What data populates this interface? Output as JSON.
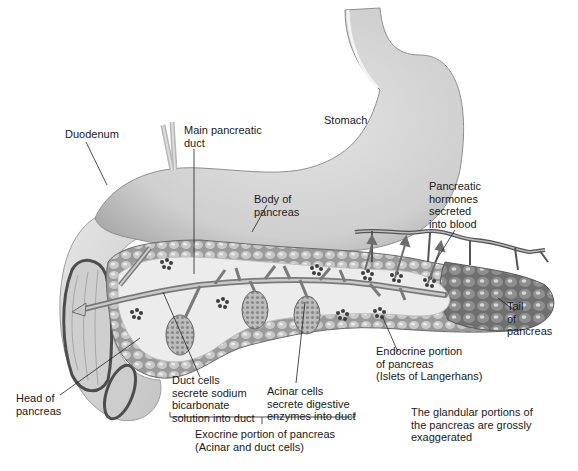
{
  "diagram": {
    "labels": {
      "duodenum": [
        "Duodenum"
      ],
      "main_duct": [
        "Main pancreatic",
        "duct"
      ],
      "stomach": [
        "Stomach"
      ],
      "body": [
        "Body of",
        "pancreas"
      ],
      "hormones": [
        "Pancreatic",
        "hormones",
        "secreted",
        "into blood"
      ],
      "tail": [
        "Tail",
        "of",
        "pancreas"
      ],
      "endocrine": [
        "Endocrine portion",
        "of pancreas",
        "(Islets of Langerhans)"
      ],
      "head": [
        "Head of",
        "pancreas"
      ],
      "duct_cells": [
        "Duct cells",
        "secrete sodium",
        "bicarbonate",
        "solution into duct"
      ],
      "acinar_cells": [
        "Acinar cells",
        "secrete digestive",
        "enzymes into duct"
      ],
      "exocrine": [
        "Exocrine portion of pancreas",
        "(Acinar and duct cells)"
      ],
      "note": [
        "The glandular portions of",
        "the pancreas are grossly",
        "exaggerated"
      ]
    },
    "colors": {
      "organ_fill": "#d9d9d9",
      "organ_shade": "#b5b5b5",
      "tissue_fill": "#e9e9e9",
      "lobule": "#8c8c8c",
      "islet": "#3d3d3d",
      "vessel": "#555555",
      "leader": "#222222"
    }
  }
}
